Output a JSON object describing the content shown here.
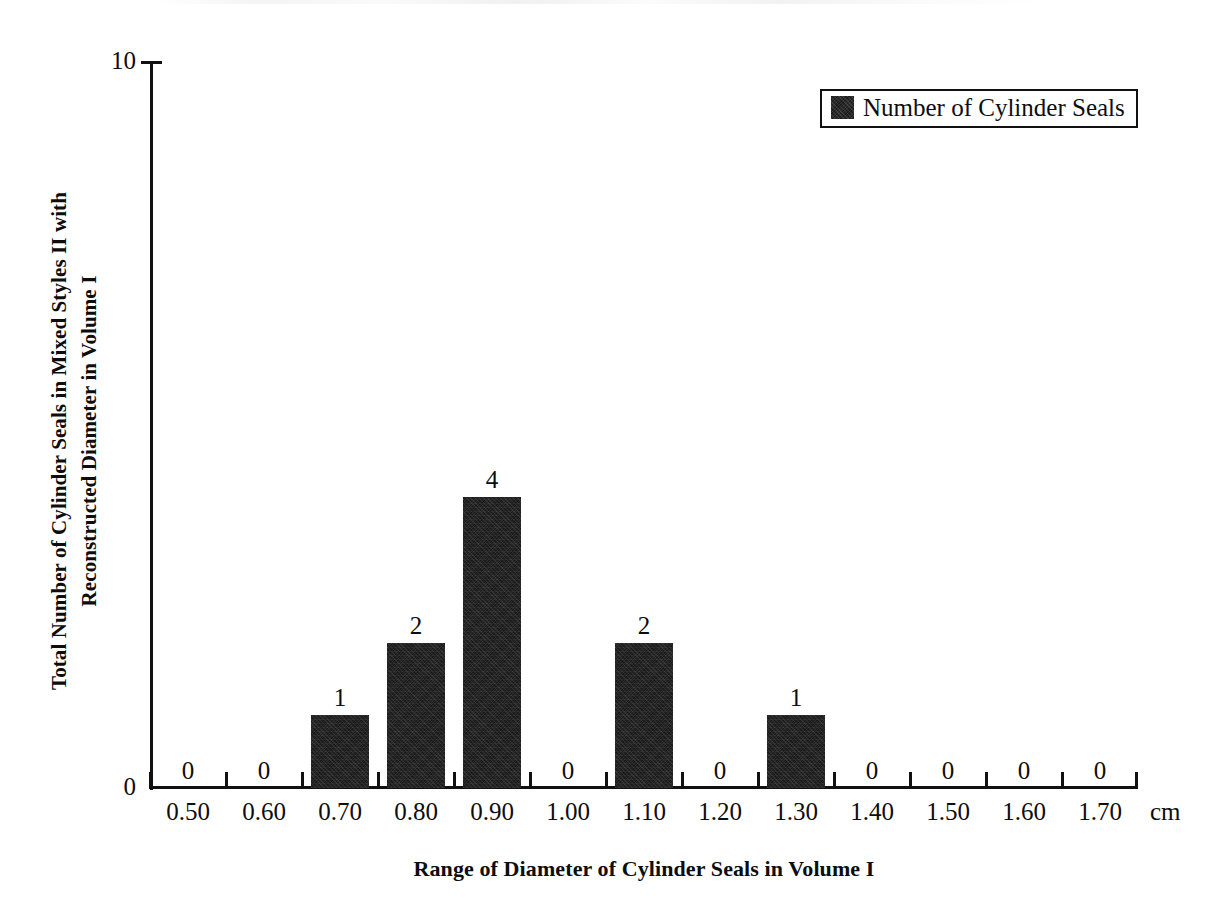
{
  "chart_data": {
    "type": "bar",
    "title": "",
    "subtitle": "",
    "xlabel": "Range of Diameter of Cylinder Seals in Volume I",
    "ylabel_line1": "Total Number of Cylinder Seals in Mixed Styles II with",
    "ylabel_line2": "Reconstructed Diameter in Volume I",
    "x_unit": "cm",
    "categories": [
      "0.50",
      "0.60",
      "0.70",
      "0.80",
      "0.90",
      "1.00",
      "1.10",
      "1.20",
      "1.30",
      "1.40",
      "1.50",
      "1.60",
      "1.70"
    ],
    "values": [
      0,
      0,
      1,
      2,
      4,
      0,
      2,
      0,
      1,
      0,
      0,
      0,
      0
    ],
    "data_labels": [
      "0",
      "0",
      "1",
      "2",
      "4",
      "0",
      "2",
      "0",
      "1",
      "0",
      "0",
      "0",
      "0"
    ],
    "series": [
      {
        "name": "Number of Cylinder Seals",
        "values": [
          0,
          0,
          1,
          2,
          4,
          0,
          2,
          0,
          1,
          0,
          0,
          0,
          0
        ],
        "color": "#1a1a1a"
      }
    ],
    "ylim": [
      0,
      10
    ],
    "y_tick_labels": [
      "0",
      "10"
    ],
    "y_tick_values": [
      0,
      10
    ],
    "grid": false,
    "legend": {
      "position": "top-right",
      "entries": [
        {
          "label": "Number of Cylinder Seals",
          "color": "#1a1a1a",
          "marker": "filled-square"
        }
      ]
    },
    "axis_color": "#111111",
    "background_color": "#ffffff"
  }
}
